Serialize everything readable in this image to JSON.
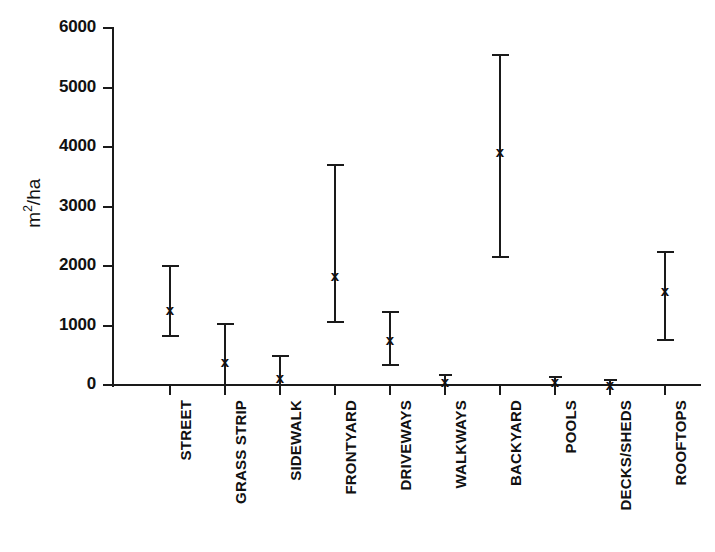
{
  "chart_data": {
    "type": "scatter",
    "title": "",
    "subtitle": "",
    "xlabel": "",
    "ylabel": "m2/ha",
    "ylabel_display": "m²/ha",
    "ylim": [
      0,
      6000
    ],
    "ytick_values": [
      0,
      1000,
      2000,
      3000,
      4000,
      5000,
      6000
    ],
    "ytick_labels": [
      "0",
      "1000",
      "2000",
      "3000",
      "4000",
      "5000",
      "6000"
    ],
    "grid": false,
    "legend": null,
    "marker": "x",
    "error_style": "capped-vertical-bars",
    "color": "#1a1a1a",
    "categories": [
      "STREET",
      "GRASS STRIP",
      "SIDEWALK",
      "FRONTYARD",
      "DRIVEWAYS",
      "WALKWAYS",
      "BACKYARD",
      "POOLS",
      "DECKS/SHEDS",
      "ROOFTOPS"
    ],
    "values": [
      1280,
      410,
      140,
      1850,
      780,
      70,
      3930,
      60,
      20,
      1590
    ],
    "error_low": [
      820,
      0,
      0,
      1060,
      340,
      0,
      2150,
      0,
      0,
      750
    ],
    "error_high": [
      2000,
      1030,
      480,
      3700,
      1220,
      160,
      5550,
      130,
      90,
      2230
    ],
    "points": [
      {
        "category": "STREET",
        "value": 1280,
        "low": 820,
        "high": 2000
      },
      {
        "category": "GRASS STRIP",
        "value": 410,
        "low": 0,
        "high": 1030
      },
      {
        "category": "SIDEWALK",
        "value": 140,
        "low": 0,
        "high": 480
      },
      {
        "category": "FRONTYARD",
        "value": 1850,
        "low": 1060,
        "high": 3700
      },
      {
        "category": "DRIVEWAYS",
        "value": 780,
        "low": 340,
        "high": 1220
      },
      {
        "category": "WALKWAYS",
        "value": 70,
        "low": 0,
        "high": 160
      },
      {
        "category": "BACKYARD",
        "value": 3930,
        "low": 2150,
        "high": 5550
      },
      {
        "category": "POOLS",
        "value": 60,
        "low": 0,
        "high": 130
      },
      {
        "category": "DECKS/SHEDS",
        "value": 20,
        "low": 0,
        "high": 90
      },
      {
        "category": "ROOFTOPS",
        "value": 1590,
        "low": 750,
        "high": 2230
      }
    ]
  }
}
